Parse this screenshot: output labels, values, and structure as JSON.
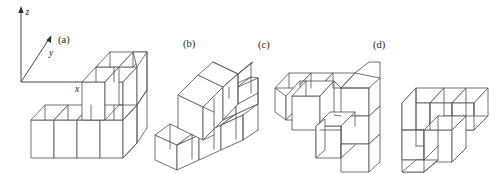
{
  "figure": {
    "background_color": "#ffffff",
    "line_color": "#58585a",
    "label_color": "#1d1d1f",
    "width": 500,
    "height": 174
  },
  "axes": {
    "origin_label": "",
    "x_label": "x",
    "y_label": "y",
    "z_label": "z",
    "arrow_color": "#2f2f31"
  },
  "panels": [
    {
      "id": "a",
      "label": "(a)",
      "label_x": 58,
      "label_y": 43,
      "view": "front-right isometric, staircase rising to the right"
    },
    {
      "id": "b",
      "label": "(b)",
      "label_x": 183,
      "label_y": 47,
      "view": "rotated isometric, tall block at upper left"
    },
    {
      "id": "c",
      "label": "(c)",
      "label_x": 258,
      "label_y": 48,
      "view": "top-down-left isometric, L-arm pointing left"
    },
    {
      "id": "d",
      "label": "(d)",
      "label_x": 373,
      "label_y": 48,
      "view": "top-down-right isometric, L-arm pointing right"
    }
  ],
  "solid": {
    "cube_count": 14,
    "shape_name": "L-shaped staircase polycube",
    "levels": [
      {
        "height": 1,
        "cells": 4
      },
      {
        "height": 2,
        "cells": 3
      },
      {
        "height": 3,
        "cells": 2
      }
    ]
  }
}
